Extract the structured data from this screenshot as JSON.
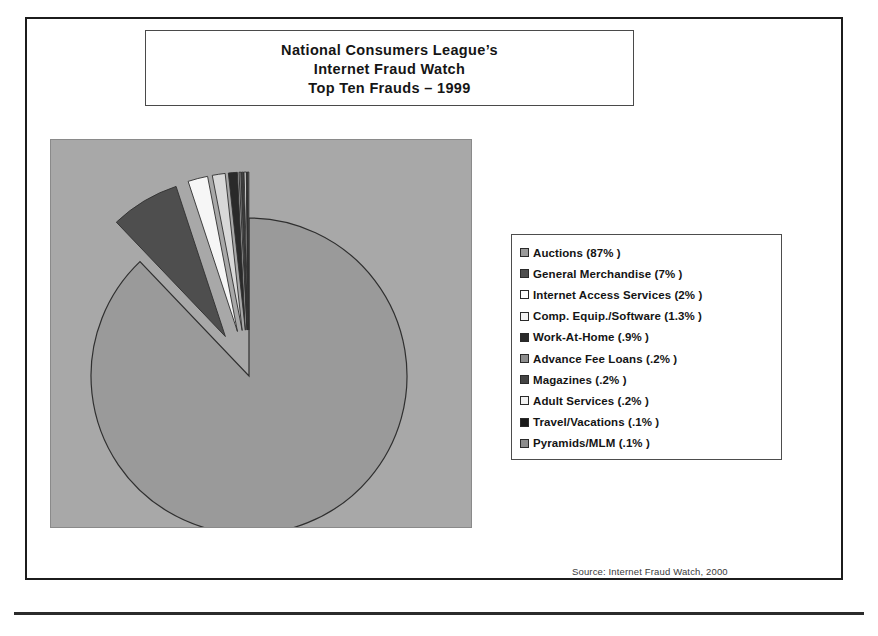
{
  "title": {
    "line1": "National Consumers League’s",
    "line2": "Internet Fraud Watch",
    "line3": "Top Ten Frauds – 1999"
  },
  "source_note": "Source: Internet Fraud Watch, 2000",
  "colors": {
    "plot_background": "#a8a8a8",
    "frame": "#1c1c1c",
    "text": "#141414"
  },
  "chart_data": {
    "type": "pie",
    "title": "National Consumers League’s Internet Fraud Watch Top Ten Frauds – 1999",
    "legend_position": "right",
    "explode_all_but_largest": true,
    "start_angle_deg": 0,
    "units": "percent",
    "categories": [
      "Auctions",
      "General Merchandise",
      "Internet Access Services",
      "Comp. Equip./Software",
      "Work-At-Home",
      "Advance Fee Loans",
      "Magazines",
      "Adult Services",
      "Travel/Vacations",
      "Pyramids/MLM"
    ],
    "values": [
      87,
      7,
      2,
      1.3,
      0.9,
      0.2,
      0.2,
      0.2,
      0.1,
      0.1
    ],
    "value_labels": [
      "87%",
      "7%",
      "2%",
      "1.3%",
      ".9%",
      ".2%",
      ".2%",
      ".2%",
      ".1%",
      ".1%"
    ],
    "slice_colors": [
      "#9a9a9a",
      "#4e4e4e",
      "#f6f6f6",
      "#d8d8d8",
      "#2a2a2a",
      "#7e7e7e",
      "#444444",
      "#ededed",
      "#1a1a1a",
      "#8c8c8c"
    ]
  },
  "legend": {
    "items": [
      {
        "label": "Auctions (87% )",
        "swatch": "#9a9a9a"
      },
      {
        "label": "General Merchandise (7% )",
        "swatch": "#4e4e4e"
      },
      {
        "label": "Internet Access Services (2% )",
        "swatch": "#ffffff"
      },
      {
        "label": "Comp. Equip./Software (1.3% )",
        "swatch": "#f2f2f2"
      },
      {
        "label": "Work-At-Home (.9% )",
        "swatch": "#2a2a2a"
      },
      {
        "label": "Advance Fee Loans (.2% )",
        "swatch": "#8e8e8e"
      },
      {
        "label": "Magazines (.2% )",
        "swatch": "#444444"
      },
      {
        "label": "Adult Services (.2% )",
        "swatch": "#f2f2f2"
      },
      {
        "label": "Travel/Vacations (.1% )",
        "swatch": "#1a1a1a"
      },
      {
        "label": "Pyramids/MLM (.1% )",
        "swatch": "#8c8c8c"
      }
    ]
  }
}
